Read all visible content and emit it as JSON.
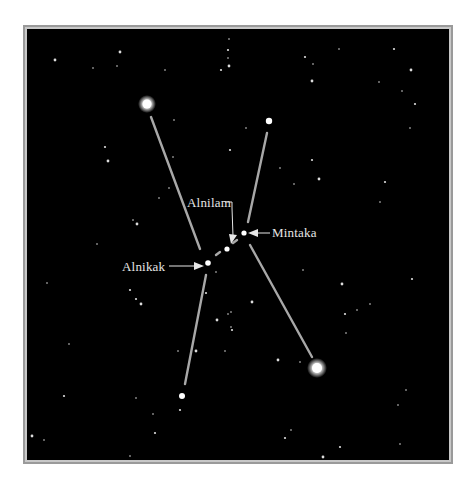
{
  "figure": {
    "background": "#000000",
    "frame_color": "#9a9a9a",
    "line_color": "#a8a8a8",
    "label_color": "#e6e6e6"
  },
  "labels": {
    "alnilam": "Alnilam",
    "mintaka": "Mintaka",
    "alnikak": "Alnikak"
  },
  "major_stars": [
    {
      "name": "betelgeuse",
      "x": 145,
      "y": 102,
      "r": 4.5,
      "glow": true
    },
    {
      "name": "bellatrix",
      "x": 267,
      "y": 119,
      "r": 3.2,
      "glow": false
    },
    {
      "name": "mintaka",
      "x": 242,
      "y": 231,
      "r": 2.6,
      "glow": false
    },
    {
      "name": "alnilam",
      "x": 225,
      "y": 247,
      "r": 2.6,
      "glow": false
    },
    {
      "name": "alnitak",
      "x": 206,
      "y": 261,
      "r": 2.8,
      "glow": false
    },
    {
      "name": "rigel",
      "x": 315,
      "y": 366,
      "r": 5,
      "glow": true
    },
    {
      "name": "saiph",
      "x": 180,
      "y": 394,
      "r": 3,
      "glow": false
    }
  ],
  "lines": [
    {
      "x1": 149,
      "y1": 115,
      "x2": 198,
      "y2": 247
    },
    {
      "x1": 265,
      "y1": 131,
      "x2": 246,
      "y2": 220
    },
    {
      "x1": 204,
      "y1": 273,
      "x2": 183,
      "y2": 382
    },
    {
      "x1": 248,
      "y1": 243,
      "x2": 310,
      "y2": 355
    },
    {
      "x1": 214,
      "y1": 253,
      "x2": 218,
      "y2": 250
    },
    {
      "x1": 231,
      "y1": 241,
      "x2": 235,
      "y2": 238
    }
  ],
  "small_stars": [
    [
      53,
      58
    ],
    [
      115,
      64
    ],
    [
      163,
      68
    ],
    [
      226,
      48
    ],
    [
      226,
      56
    ],
    [
      227,
      64
    ],
    [
      219,
      68
    ],
    [
      227,
      37
    ],
    [
      172,
      118
    ],
    [
      103,
      145
    ],
    [
      106,
      159
    ],
    [
      171,
      155
    ],
    [
      228,
      148
    ],
    [
      167,
      186
    ],
    [
      157,
      196
    ],
    [
      135,
      222
    ],
    [
      95,
      242
    ],
    [
      131,
      218
    ],
    [
      134,
      297
    ],
    [
      91,
      66
    ],
    [
      118,
      50
    ],
    [
      303,
      55
    ],
    [
      311,
      62
    ],
    [
      337,
      47
    ],
    [
      392,
      47
    ],
    [
      409,
      68
    ],
    [
      400,
      89
    ],
    [
      413,
      102
    ],
    [
      408,
      126
    ],
    [
      377,
      80
    ],
    [
      310,
      79
    ],
    [
      244,
      126
    ],
    [
      278,
      166
    ],
    [
      310,
      158
    ],
    [
      292,
      182
    ],
    [
      317,
      177
    ],
    [
      383,
      180
    ],
    [
      378,
      200
    ],
    [
      301,
      268
    ],
    [
      410,
      277
    ],
    [
      340,
      282
    ],
    [
      368,
      302
    ],
    [
      343,
      312
    ],
    [
      355,
      308
    ],
    [
      344,
      331
    ],
    [
      276,
      358
    ],
    [
      404,
      388
    ],
    [
      396,
      403
    ],
    [
      283,
      436
    ],
    [
      289,
      428
    ],
    [
      321,
      455
    ],
    [
      338,
      445
    ],
    [
      398,
      442
    ],
    [
      214,
      270
    ],
    [
      204,
      291
    ],
    [
      215,
      318
    ],
    [
      229,
      310
    ],
    [
      230,
      328
    ],
    [
      229,
      325
    ],
    [
      176,
      349
    ],
    [
      194,
      349
    ],
    [
      223,
      349
    ],
    [
      45,
      281
    ],
    [
      128,
      288
    ],
    [
      67,
      342
    ],
    [
      139,
      302
    ],
    [
      62,
      394
    ],
    [
      134,
      396
    ],
    [
      151,
      412
    ],
    [
      178,
      408
    ],
    [
      30,
      434
    ],
    [
      42,
      438
    ],
    [
      153,
      431
    ],
    [
      128,
      454
    ],
    [
      226,
      312
    ],
    [
      250,
      300
    ],
    [
      298,
      360
    ]
  ]
}
